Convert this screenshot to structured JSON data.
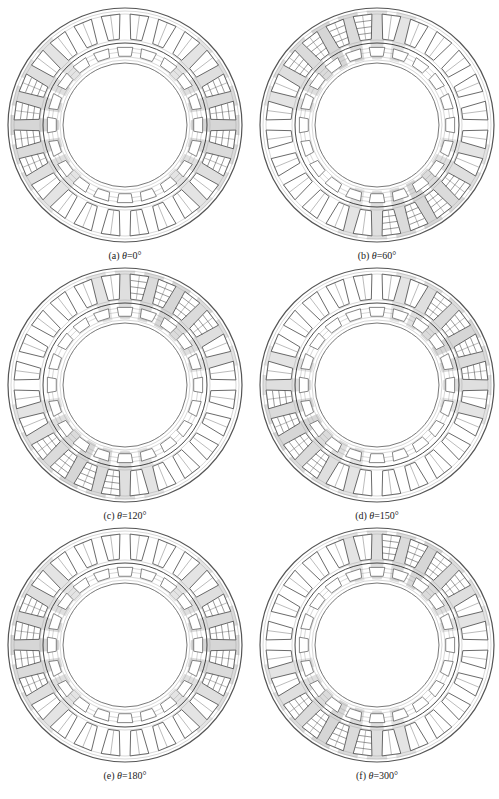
{
  "figure": {
    "panels": [
      {
        "id": "a",
        "label": "(a)",
        "symbol": "θ",
        "value": "=0°",
        "angle_deg": 0,
        "cx": 125,
        "cy": 125,
        "cap_y": 250
      },
      {
        "id": "b",
        "label": "(b)",
        "symbol": "θ",
        "value": "=60°",
        "angle_deg": 60,
        "cx": 377,
        "cy": 125,
        "cap_y": 250
      },
      {
        "id": "c",
        "label": "(c)",
        "symbol": "θ",
        "value": "=120°",
        "angle_deg": 120,
        "cx": 125,
        "cy": 385,
        "cap_y": 510
      },
      {
        "id": "d",
        "label": "(d)",
        "symbol": "θ",
        "value": "=150°",
        "angle_deg": 150,
        "cx": 377,
        "cy": 385,
        "cap_y": 510
      },
      {
        "id": "e",
        "label": "(e)",
        "symbol": "θ",
        "value": "=180°",
        "angle_deg": 180,
        "cx": 125,
        "cy": 645,
        "cap_y": 770
      },
      {
        "id": "f",
        "label": "(f)",
        "symbol": "θ",
        "value": "=300°",
        "angle_deg": 300,
        "cx": 377,
        "cy": 645,
        "cap_y": 770
      }
    ],
    "geometry": {
      "outer_radius": 117,
      "stator_inner_radius": 82,
      "rotor_outer_radius": 80,
      "rotor_inner_radius": 62,
      "stator_slots": 24,
      "rotor_slots": 20
    },
    "colors": {
      "line": "#555555",
      "flux_dense": "#8a8a8a",
      "background": "#ffffff"
    }
  }
}
